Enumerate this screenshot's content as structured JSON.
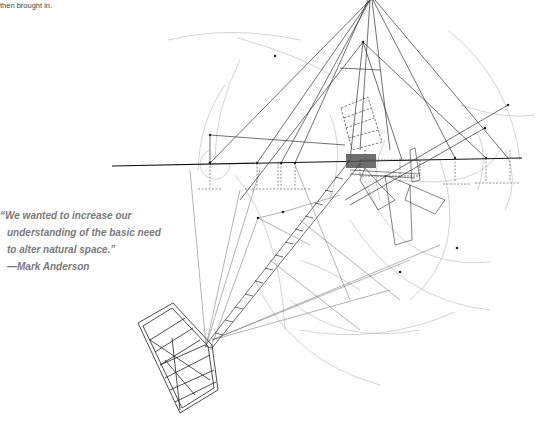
{
  "caption": {
    "text_tail": "then brought in."
  },
  "pull_quote": {
    "lines": [
      "“We wanted to increase our",
      "understanding of the basic need",
      "to alter natural space.”",
      "—Mark Anderson"
    ],
    "color": "#7a7a7a"
  },
  "figure": {
    "line_color": "#222222",
    "construction_color": "#9a9a9a"
  }
}
